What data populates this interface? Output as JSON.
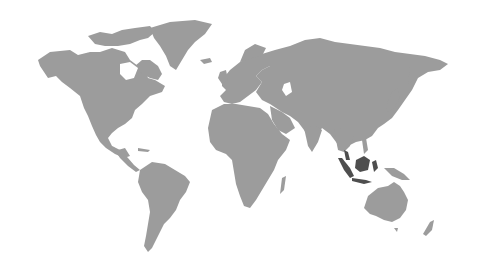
{
  "map": {
    "type": "world-map",
    "style": "halftone-gray",
    "land_color": "#9c9c9c",
    "highlight_color": "#4e4e4e",
    "background_color": "#ffffff",
    "highlighted_regions": [
      "Indonesia",
      "Malaysia"
    ],
    "continents": [
      "North America",
      "Greenland",
      "South America",
      "Europe",
      "Africa",
      "Asia",
      "Australia",
      "New Zealand"
    ]
  }
}
